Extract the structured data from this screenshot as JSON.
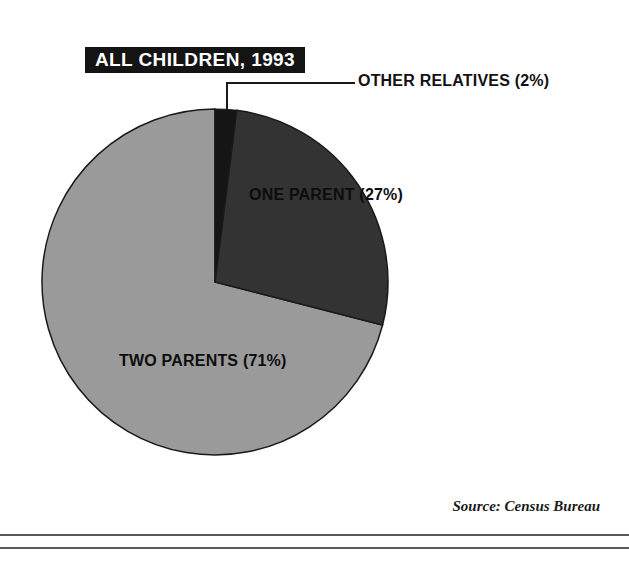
{
  "title": {
    "text": "ALL CHILDREN, 1993"
  },
  "source": {
    "text": "Source: Census Bureau"
  },
  "labels": {
    "other_relatives": "OTHER RELATIVES (2%)",
    "one_parent": "ONE PARENT (27%)",
    "two_parents": "TWO PARENTS (71%)"
  },
  "colors": {
    "two_parents": "#9a9a9a",
    "one_parent": "#333333",
    "other_relatives": "#151515",
    "outline": "#1a1a1a",
    "banner_bg": "#141414",
    "banner_text": "#ffffff",
    "rule": "#5a5a5a"
  },
  "chart_data": {
    "type": "pie",
    "title": "ALL CHILDREN, 1993",
    "subtitle": "",
    "xlabel": "",
    "ylabel": "",
    "grid": false,
    "legend_position": "in-slice",
    "units": "percent",
    "start_angle_deg": 0,
    "direction": "clockwise",
    "categories": [
      "OTHER RELATIVES",
      "ONE PARENT",
      "TWO PARENTS"
    ],
    "values": [
      2,
      27,
      71
    ],
    "slices": [
      {
        "label": "OTHER RELATIVES",
        "display_label": "OTHER RELATIVES (2%)",
        "value": 2,
        "color": "#151515",
        "start_deg": 0,
        "end_deg": 7.2,
        "label_placement": "callout-right"
      },
      {
        "label": "ONE PARENT",
        "display_label": "ONE PARENT (27%)",
        "value": 27,
        "color": "#333333",
        "start_deg": 7.2,
        "end_deg": 104.4,
        "label_placement": "inside"
      },
      {
        "label": "TWO PARENTS",
        "display_label": "TWO PARENTS (71%)",
        "value": 71,
        "color": "#9a9a9a",
        "start_deg": 104.4,
        "end_deg": 360,
        "label_placement": "inside"
      }
    ],
    "annotations": [
      "Source: Census Bureau"
    ],
    "geometry": {
      "center_x": 215,
      "center_y": 282,
      "radius": 173
    }
  }
}
